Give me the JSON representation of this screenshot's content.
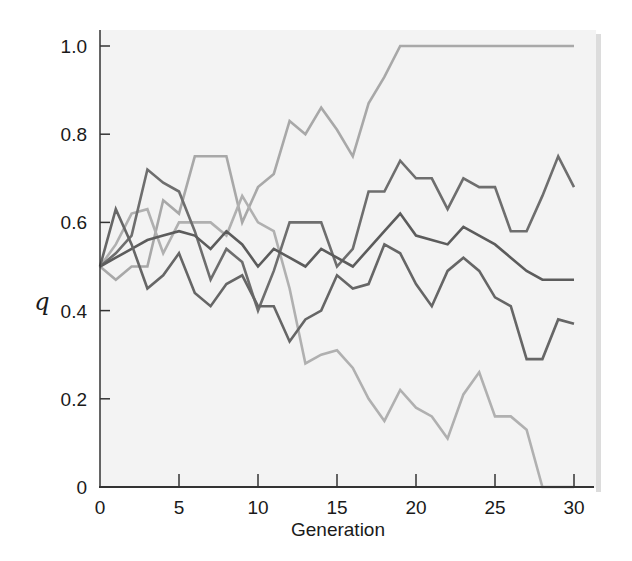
{
  "chart_data": {
    "type": "line",
    "title": "",
    "xlabel": "Generation",
    "ylabel": "q",
    "xlim": [
      0,
      30
    ],
    "ylim": [
      0,
      1.0
    ],
    "xticks": [
      0,
      5,
      10,
      15,
      20,
      25,
      30
    ],
    "xtick_labels": [
      "0",
      "5",
      "10",
      "15",
      "20",
      "25",
      "30"
    ],
    "yticks": [
      0,
      0.2,
      0.4,
      0.6,
      0.8,
      1.0
    ],
    "ytick_labels": [
      "0",
      "0.2",
      "0.4",
      "0.6",
      "0.8",
      "1.0"
    ],
    "grid": false,
    "legend": null,
    "x": [
      0,
      1,
      2,
      3,
      4,
      5,
      6,
      7,
      8,
      9,
      10,
      11,
      12,
      13,
      14,
      15,
      16,
      17,
      18,
      19,
      20,
      21,
      22,
      23,
      24,
      25,
      26,
      27,
      28,
      29,
      30
    ],
    "series": [
      {
        "name": "population-fixed-1",
        "color": "#a8a8a8",
        "values": [
          0.5,
          0.47,
          0.5,
          0.5,
          0.65,
          0.62,
          0.75,
          0.75,
          0.75,
          0.6,
          0.68,
          0.71,
          0.83,
          0.8,
          0.86,
          0.81,
          0.75,
          0.87,
          0.93,
          1.0,
          1.0,
          1.0,
          1.0,
          1.0,
          1.0,
          1.0,
          1.0,
          1.0,
          1.0,
          1.0,
          1.0
        ]
      },
      {
        "name": "population-lost-0",
        "color": "#b0b0b0",
        "values": [
          0.5,
          0.55,
          0.62,
          0.63,
          0.53,
          0.6,
          0.6,
          0.6,
          0.57,
          0.66,
          0.6,
          0.58,
          0.45,
          0.28,
          0.3,
          0.31,
          0.27,
          0.2,
          0.15,
          0.22,
          0.18,
          0.16,
          0.11,
          0.21,
          0.26,
          0.16,
          0.16,
          0.13,
          0.0,
          0.0,
          0.0
        ]
      },
      {
        "name": "population-high",
        "color": "#6e6e6e",
        "values": [
          0.5,
          0.53,
          0.57,
          0.72,
          0.69,
          0.67,
          0.58,
          0.47,
          0.54,
          0.51,
          0.4,
          0.49,
          0.6,
          0.6,
          0.6,
          0.5,
          0.54,
          0.67,
          0.67,
          0.74,
          0.7,
          0.7,
          0.63,
          0.7,
          0.68,
          0.68,
          0.58,
          0.58,
          0.66,
          0.75,
          0.68
        ]
      },
      {
        "name": "population-middle",
        "color": "#5c5c5c",
        "values": [
          0.5,
          0.52,
          0.54,
          0.56,
          0.57,
          0.58,
          0.57,
          0.54,
          0.58,
          0.55,
          0.5,
          0.54,
          0.52,
          0.5,
          0.54,
          0.52,
          0.5,
          0.54,
          0.58,
          0.62,
          0.57,
          0.56,
          0.55,
          0.59,
          0.57,
          0.55,
          0.52,
          0.49,
          0.47,
          0.47,
          0.47
        ]
      },
      {
        "name": "population-low",
        "color": "#666666",
        "values": [
          0.5,
          0.63,
          0.55,
          0.45,
          0.48,
          0.53,
          0.44,
          0.41,
          0.46,
          0.48,
          0.41,
          0.41,
          0.33,
          0.38,
          0.4,
          0.48,
          0.45,
          0.46,
          0.55,
          0.53,
          0.46,
          0.41,
          0.49,
          0.52,
          0.49,
          0.43,
          0.41,
          0.29,
          0.29,
          0.38,
          0.37
        ]
      }
    ]
  },
  "plot_area": {
    "background": "#f3f3f3",
    "axis_color": "#333333"
  }
}
